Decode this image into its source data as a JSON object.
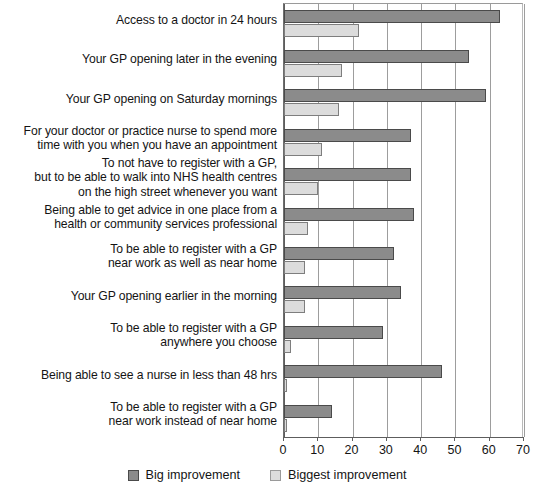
{
  "chart_data": {
    "type": "bar",
    "orientation": "horizontal",
    "title": "",
    "xlabel": "",
    "ylabel": "",
    "xlim": [
      0,
      70
    ],
    "xticks": [
      0,
      10,
      20,
      30,
      40,
      50,
      60,
      70
    ],
    "grid": true,
    "legend_position": "bottom",
    "categories": [
      "Access to a doctor in 24 hours",
      "Your GP opening later in the evening",
      "Your GP opening on Saturday mornings",
      "For your doctor or practice nurse to spend more\ntime with you when you have an appointment",
      "To not have to register with a GP,\nbut to be able to walk into NHS health centres\non the high street whenever you want",
      "Being able to get advice in one place from a\nhealth or community services professional",
      "To be able to register with a GP\nnear work as well as near home",
      "Your GP opening earlier in the morning",
      "To be able to register with a GP\nanywhere you choose",
      "Being able to see a nurse in less than 48 hrs",
      "To be able to register with a GP\nnear work instead of near home"
    ],
    "series": [
      {
        "name": "Big improvement",
        "color": "#8b8b8b",
        "values": [
          63,
          54,
          59,
          37,
          37,
          38,
          32,
          34,
          29,
          46,
          14
        ]
      },
      {
        "name": "Biggest improvement",
        "color": "#dcdcdc",
        "values": [
          22,
          17,
          16,
          11,
          10,
          7,
          6,
          6,
          2,
          1,
          1
        ]
      }
    ]
  },
  "legend": {
    "items": [
      {
        "label": "Big improvement",
        "swatch": "big"
      },
      {
        "label": "Biggest improvement",
        "swatch": "biggest"
      }
    ]
  }
}
